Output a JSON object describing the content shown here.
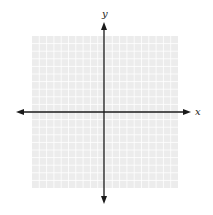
{
  "diagram": {
    "type": "coordinate-plane",
    "x_axis_label": "x",
    "y_axis_label": "y",
    "grid": {
      "columns": 20,
      "rows": 20,
      "left": 32,
      "top": 36,
      "right": 178,
      "bottom": 188,
      "fill_color": "#ececec",
      "line_color": "#ffffff"
    },
    "axes": {
      "color": "#1a1a1a",
      "origin_x": 104,
      "origin_y": 112,
      "x_axis_start": 16,
      "x_axis_end": 191,
      "y_axis_start": 22,
      "y_axis_end": 204
    }
  }
}
